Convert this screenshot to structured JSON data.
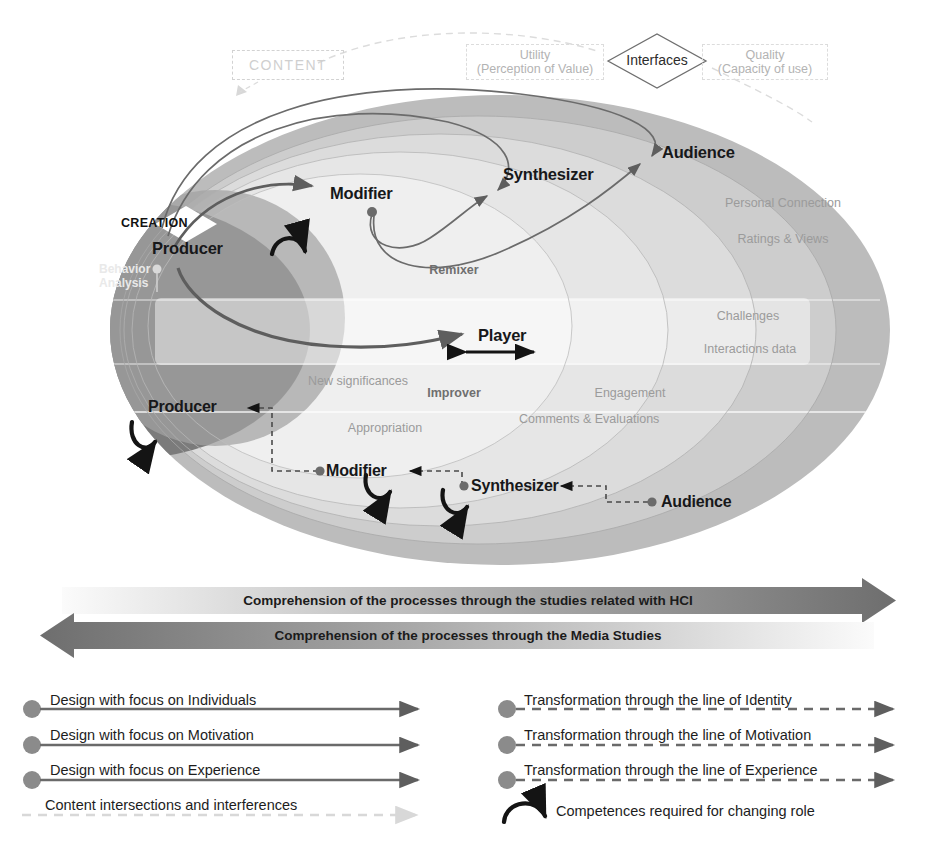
{
  "diagram": {
    "content_box": {
      "label": "CONTENT"
    },
    "interfaces": {
      "node_label": "Interfaces",
      "left_line1": "Utility",
      "left_line2": "(Perception of Value)",
      "right_line1": "Quality",
      "right_line2": "(Capacity of use)"
    },
    "creation_badge": {
      "label": "CREATION"
    },
    "behavior_analysis": {
      "line1": "Behavior",
      "line2": "Analysis"
    },
    "roles_top": [
      {
        "label": "Producer"
      },
      {
        "label": "Modifier"
      },
      {
        "label": "Synthesizer"
      },
      {
        "label": "Audience"
      },
      {
        "label": "Player"
      }
    ],
    "roles_bottom": [
      {
        "label": "Producer"
      },
      {
        "label": "Modifier"
      },
      {
        "label": "Synthesizer"
      },
      {
        "label": "Audience"
      }
    ],
    "ring_labels": [
      {
        "label": "Remixer"
      },
      {
        "label": "Improver"
      },
      {
        "label": "Engagement"
      },
      {
        "label": "Personal Connection"
      },
      {
        "label": "Ratings & Views"
      },
      {
        "label": "Challenges"
      },
      {
        "label": "Interactions data"
      },
      {
        "label": "New significances"
      },
      {
        "label": "Appropriation"
      },
      {
        "label": "Comments & Evaluations"
      }
    ],
    "bands": [
      {
        "label": "Comprehension of the processes through the studies related with HCI",
        "direction": "right"
      },
      {
        "label": "Comprehension of the processes through the Media Studies",
        "direction": "left"
      }
    ],
    "legend_left": [
      {
        "label": "Design with focus on Individuals",
        "style": "solid"
      },
      {
        "label": "Design with focus on Motivation",
        "style": "solid"
      },
      {
        "label": "Design with focus on Experience",
        "style": "solid"
      },
      {
        "label": "Content intersections and interferences",
        "style": "dashed-light"
      }
    ],
    "legend_right": [
      {
        "label": "Transformation through the line of Identity",
        "style": "dashed"
      },
      {
        "label": "Transformation through the line of Motivation",
        "style": "dashed"
      },
      {
        "label": "Transformation through the line of Experience",
        "style": "dashed"
      },
      {
        "label": "Competences required for changing role",
        "style": "arc"
      }
    ],
    "colors": {
      "outer_ellipse": "#b9b9b9",
      "mid_ellipse": "#cfcfcf",
      "inner_ellipse": "#e2e2e2",
      "core_ellipse": "#efefef",
      "dark_region": "#787878",
      "mid_dark_region": "#9a9a9a",
      "arrow_dark": "#5e5e5e",
      "arrow_black": "#111111",
      "band_dark": "#767676",
      "band_light": "#f2f2f2",
      "faint_text": "#9b9b9b"
    }
  }
}
